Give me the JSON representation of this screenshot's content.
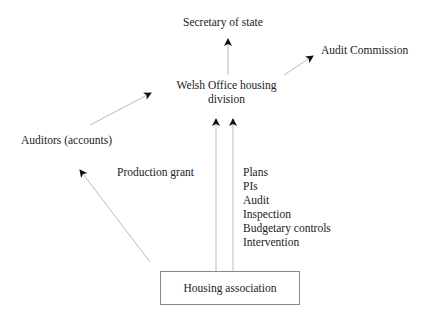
{
  "nodes": {
    "secretary": "Secretary of state",
    "audit_commission": "Audit Commission",
    "welsh_office_line1": "Welsh Office housing",
    "welsh_office_line2": "division",
    "auditors": "Auditors (accounts)",
    "housing_association": "Housing association"
  },
  "edge_labels": {
    "production_grant": "Production grant",
    "controls": [
      "Plans",
      "PIs",
      "Audit",
      "Inspection",
      "Budgetary controls",
      "Intervention"
    ]
  }
}
